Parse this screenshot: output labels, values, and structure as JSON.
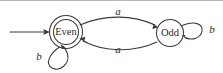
{
  "diagram": {
    "type": "finite-state-machine",
    "title": "",
    "background_color": "#ffffff",
    "stroke_color": "#3a3a3a",
    "text_color": "#2b2b2b",
    "states": [
      {
        "id": "even",
        "label": "Even",
        "accepting": true,
        "start": true,
        "cx": 66,
        "cy": 32,
        "r": 16
      },
      {
        "id": "odd",
        "label": "Odd",
        "accepting": false,
        "start": false,
        "cx": 170,
        "cy": 33,
        "r": 13
      }
    ],
    "transitions": [
      {
        "id": "even-to-odd",
        "from": "even",
        "to": "odd",
        "symbol": "a",
        "shape": "arc-top",
        "label_x": 118,
        "label_y": 12
      },
      {
        "id": "odd-to-even",
        "from": "odd",
        "to": "even",
        "symbol": "a",
        "shape": "arc-bottom",
        "label_x": 118,
        "label_y": 50
      },
      {
        "id": "even-self-loop",
        "from": "even",
        "to": "even",
        "symbol": "b",
        "shape": "self-loop-bottom-left",
        "label_x": 39,
        "label_y": 57
      },
      {
        "id": "odd-self-loop",
        "from": "odd",
        "to": "odd",
        "symbol": "b",
        "shape": "self-loop-right",
        "label_x": 212,
        "label_y": 30
      }
    ],
    "start_arrow": {
      "id": "start-arrow",
      "label": "",
      "from_x": 10,
      "to_x": 49,
      "y": 32
    }
  }
}
